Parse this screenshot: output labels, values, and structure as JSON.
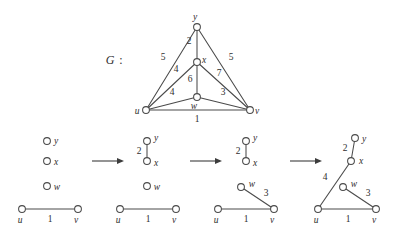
{
  "figure": {
    "caption_label": "G",
    "caption_separator": ":",
    "vertices": [
      "u",
      "v",
      "w",
      "x",
      "y"
    ],
    "stroke_color": "#4a4a4a",
    "text_color": "#2e2e2e",
    "background": "#ffffff"
  },
  "graph_g": {
    "name": "G",
    "nodes": [
      {
        "id": "u",
        "label": "u",
        "x": 146,
        "y": 110,
        "label_dx": -9,
        "label_dy": 4
      },
      {
        "id": "v",
        "label": "v",
        "x": 250,
        "y": 110,
        "label_dx": 7,
        "label_dy": 4
      },
      {
        "id": "w",
        "label": "w",
        "x": 197,
        "y": 97,
        "label_dx": -3,
        "label_dy": 12
      },
      {
        "id": "x",
        "label": "x",
        "x": 197,
        "y": 62,
        "label_dx": 7,
        "label_dy": 1
      },
      {
        "id": "y",
        "label": "y",
        "x": 197,
        "y": 27,
        "label_dx": -2,
        "label_dy": -7
      }
    ],
    "edges": [
      {
        "from": "u",
        "to": "y",
        "weight": "5",
        "lx": 163,
        "ly": 60
      },
      {
        "from": "y",
        "to": "v",
        "weight": "5",
        "lx": 231,
        "ly": 60
      },
      {
        "from": "x",
        "to": "y",
        "weight": "2",
        "lx": 189,
        "ly": 44
      },
      {
        "from": "u",
        "to": "x",
        "weight": "4",
        "lx": 176,
        "ly": 72
      },
      {
        "from": "x",
        "to": "v",
        "weight": "7",
        "lx": 219,
        "ly": 76
      },
      {
        "from": "x",
        "to": "w",
        "weight": "6",
        "lx": 190,
        "ly": 82
      },
      {
        "from": "u",
        "to": "w",
        "weight": "4",
        "lx": 172,
        "ly": 95
      },
      {
        "from": "w",
        "to": "v",
        "weight": "3",
        "lx": 223,
        "ly": 95
      },
      {
        "from": "u",
        "to": "v",
        "weight": "1",
        "lx": 197,
        "ly": 122
      }
    ]
  },
  "steps": [
    {
      "index": 1,
      "nodes": [
        {
          "id": "y",
          "label": "y",
          "x": 47,
          "y": 141,
          "label_dx": 7,
          "label_dy": 3
        },
        {
          "id": "x",
          "label": "x",
          "x": 47,
          "y": 161,
          "label_dx": 7,
          "label_dy": 4
        },
        {
          "id": "w",
          "label": "w",
          "x": 47,
          "y": 186,
          "label_dx": 7,
          "label_dy": 4
        },
        {
          "id": "u",
          "label": "u",
          "x": 22,
          "y": 209,
          "label_dx": -2,
          "label_dy": 14
        },
        {
          "id": "v",
          "label": "v",
          "x": 78,
          "y": 209,
          "label_dx": -2,
          "label_dy": 14
        }
      ],
      "edges": [
        {
          "from": "u",
          "to": "v",
          "weight": "1",
          "lx": 50,
          "ly": 222
        }
      ]
    },
    {
      "index": 2,
      "nodes": [
        {
          "id": "y",
          "label": "y",
          "x": 147,
          "y": 141,
          "label_dx": 7,
          "label_dy": 3
        },
        {
          "id": "x",
          "label": "x",
          "x": 147,
          "y": 161,
          "label_dx": 7,
          "label_dy": 4
        },
        {
          "id": "w",
          "label": "w",
          "x": 147,
          "y": 186,
          "label_dx": 7,
          "label_dy": 4
        },
        {
          "id": "u",
          "label": "u",
          "x": 120,
          "y": 209,
          "label_dx": -2,
          "label_dy": 14
        },
        {
          "id": "v",
          "label": "v",
          "x": 176,
          "y": 209,
          "label_dx": -2,
          "label_dy": 14
        }
      ],
      "edges": [
        {
          "from": "y",
          "to": "x",
          "weight": "2",
          "lx": 139,
          "ly": 154
        },
        {
          "from": "u",
          "to": "v",
          "weight": "1",
          "lx": 148,
          "ly": 222
        }
      ]
    },
    {
      "index": 3,
      "nodes": [
        {
          "id": "y",
          "label": "y",
          "x": 246,
          "y": 141,
          "label_dx": 7,
          "label_dy": 3
        },
        {
          "id": "x",
          "label": "x",
          "x": 246,
          "y": 161,
          "label_dx": 7,
          "label_dy": 4
        },
        {
          "id": "w",
          "label": "w",
          "x": 241,
          "y": 187,
          "label_dx": 7,
          "label_dy": 1
        },
        {
          "id": "u",
          "label": "u",
          "x": 218,
          "y": 209,
          "label_dx": -2,
          "label_dy": 14
        },
        {
          "id": "v",
          "label": "v",
          "x": 274,
          "y": 209,
          "label_dx": -2,
          "label_dy": 14
        }
      ],
      "edges": [
        {
          "from": "y",
          "to": "x",
          "weight": "2",
          "lx": 238,
          "ly": 154
        },
        {
          "from": "w",
          "to": "v",
          "weight": "3",
          "lx": 266,
          "ly": 196
        },
        {
          "from": "u",
          "to": "v",
          "weight": "1",
          "lx": 246,
          "ly": 222
        }
      ]
    },
    {
      "index": 4,
      "nodes": [
        {
          "id": "y",
          "label": "y",
          "x": 355,
          "y": 138,
          "label_dx": 7,
          "label_dy": 4
        },
        {
          "id": "x",
          "label": "x",
          "x": 351,
          "y": 161,
          "label_dx": 7,
          "label_dy": 3
        },
        {
          "id": "w",
          "label": "w",
          "x": 343,
          "y": 187,
          "label_dx": 7,
          "label_dy": 1
        },
        {
          "id": "u",
          "label": "u",
          "x": 318,
          "y": 209,
          "label_dx": -2,
          "label_dy": 14
        },
        {
          "id": "v",
          "label": "v",
          "x": 376,
          "y": 209,
          "label_dx": -2,
          "label_dy": 14
        }
      ],
      "edges": [
        {
          "from": "y",
          "to": "x",
          "weight": "2",
          "lx": 345,
          "ly": 151
        },
        {
          "from": "u",
          "to": "x",
          "weight": "4",
          "lx": 325,
          "ly": 180
        },
        {
          "from": "w",
          "to": "v",
          "weight": "3",
          "lx": 368,
          "ly": 196
        },
        {
          "from": "u",
          "to": "v",
          "weight": "1",
          "lx": 348,
          "ly": 222
        }
      ]
    }
  ],
  "arrows": [
    {
      "index": 1,
      "x1": 92,
      "y1": 161,
      "x2": 124,
      "y2": 161
    },
    {
      "index": 2,
      "x1": 190,
      "y1": 161,
      "x2": 222,
      "y2": 161
    },
    {
      "index": 3,
      "x1": 290,
      "y1": 161,
      "x2": 322,
      "y2": 161
    }
  ],
  "caption": {
    "label_x": 110,
    "label_y": 64,
    "colon_x": 121,
    "colon_y": 64
  }
}
